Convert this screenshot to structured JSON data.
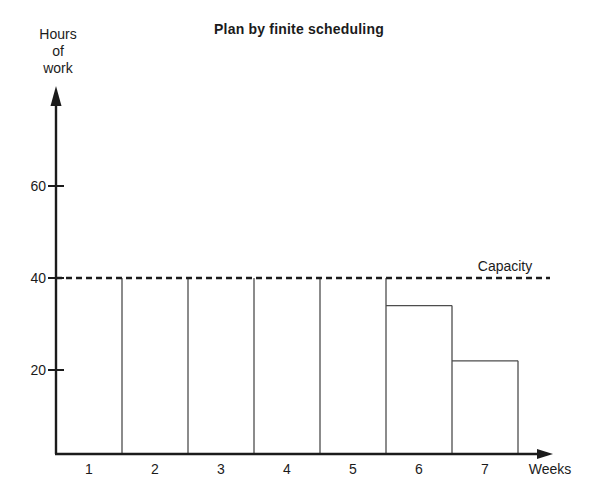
{
  "chart_data": {
    "type": "bar",
    "title": "Plan by finite scheduling",
    "ylabel_lines": [
      "Hours",
      "of",
      "work"
    ],
    "xlabel": "Weeks",
    "categories": [
      "1",
      "2",
      "3",
      "4",
      "5",
      "6",
      "7"
    ],
    "values": [
      40,
      40,
      40,
      40,
      40,
      34,
      22
    ],
    "yticks": [
      20,
      40,
      60
    ],
    "ylim": [
      0,
      80
    ],
    "capacity": 40,
    "capacity_label": "Capacity",
    "legend": "none",
    "grid": false,
    "bar_style": "contiguous-outline",
    "colors": {
      "ink": "#1b1b1b",
      "bar_outline": "#4d4d4d",
      "background": "#ffffff"
    }
  }
}
